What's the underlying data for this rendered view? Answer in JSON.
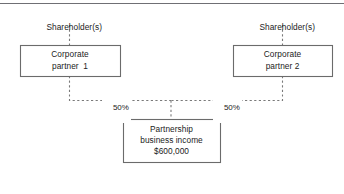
{
  "diagram": {
    "colors": {
      "box_border": "#6b6b6b",
      "connector": "#7a7a7a",
      "text": "#1b1b1b",
      "rule": "#6f6f74",
      "background": "#ffffff"
    },
    "top_rule": true,
    "nodes": [
      {
        "id": "shareholders-left",
        "kind": "plain-label",
        "lines": [
          "Shareholder(s)"
        ],
        "x": 33,
        "y": 11,
        "width": 73,
        "height": 12
      },
      {
        "id": "shareholders-right",
        "kind": "plain-label",
        "lines": [
          "Shareholder(s)"
        ],
        "x": 246,
        "y": 11,
        "width": 73,
        "height": 12
      },
      {
        "id": "corporate-partner-1",
        "kind": "box",
        "lines": [
          "Corporate",
          "partner  1"
        ],
        "x": 20,
        "y": 45,
        "width": 100,
        "height": 31
      },
      {
        "id": "corporate-partner-2",
        "kind": "box",
        "lines": [
          "Corporate",
          "partner 2"
        ],
        "x": 233,
        "y": 45,
        "width": 99,
        "height": 31
      },
      {
        "id": "partnership-business-income",
        "kind": "box",
        "lines": [
          "Partnership",
          "business income",
          "$600,000"
        ],
        "x": 123,
        "y": 119,
        "width": 97,
        "height": 43
      }
    ],
    "edge_labels": [
      {
        "id": "share-left",
        "text": "50%",
        "x": 102,
        "y": 93
      },
      {
        "id": "share-right",
        "text": "50%",
        "x": 213,
        "y": 93
      }
    ],
    "connectors": [
      {
        "id": "shareholders-left-to-partner1",
        "path": "M 69.5 25 L 69.5 45"
      },
      {
        "id": "shareholders-right-to-partner2",
        "path": "M 282.5 25 L 282.5 45"
      },
      {
        "id": "partner1-to-junction",
        "path": "M 69.5 76 L 69.5 100.5 L 171 100.5"
      },
      {
        "id": "partner2-to-junction",
        "path": "M 282.5 76 L 282.5 100.5 L 171 100.5"
      },
      {
        "id": "junction-to-partnership",
        "path": "M 171 100.5 L 171 119"
      }
    ]
  }
}
